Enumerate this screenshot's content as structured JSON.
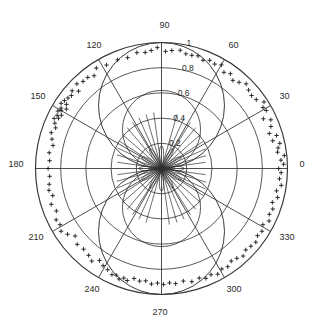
{
  "figure": {
    "title": "",
    "background_color": "#ffffff",
    "line_color": "#3a3a3a",
    "marker_color": "#1a1a1a",
    "curve_color": "#2f2f2f"
  },
  "chart_data": {
    "type": "scatter",
    "projection": "polar",
    "title": "",
    "xlabel": "",
    "ylabel": "",
    "grid": true,
    "legend": false,
    "angle_unit": "degrees",
    "theta_direction": "counterclockwise",
    "theta_zero_location": "E",
    "rlim": [
      0,
      1
    ],
    "angular_ticks": [
      0,
      30,
      60,
      90,
      120,
      150,
      180,
      210,
      240,
      270,
      300,
      330
    ],
    "angular_tick_labels": [
      "0",
      "30",
      "60",
      "90",
      "120",
      "150",
      "180",
      "210",
      "240",
      "270",
      "300",
      "330"
    ],
    "radial_ticks": [
      0.2,
      0.4,
      0.6,
      0.8,
      1.0
    ],
    "radial_tick_labels": [
      "0.2",
      "0.4",
      "0.6",
      "0.8",
      "1"
    ],
    "radial_label_angle": 80,
    "series": [
      {
        "name": "reference-curve",
        "type": "line",
        "description": "vertical lobe pattern |sin(theta)| type response",
        "theta": [
          0,
          5,
          10,
          15,
          20,
          25,
          30,
          35,
          40,
          45,
          50,
          55,
          60,
          65,
          70,
          75,
          80,
          85,
          90,
          95,
          100,
          105,
          110,
          115,
          120,
          125,
          130,
          135,
          140,
          145,
          150,
          155,
          160,
          165,
          170,
          175,
          180,
          185,
          190,
          195,
          200,
          205,
          210,
          215,
          220,
          225,
          230,
          235,
          240,
          245,
          250,
          255,
          260,
          265,
          270,
          275,
          280,
          285,
          290,
          295,
          300,
          305,
          310,
          315,
          320,
          325,
          330,
          335,
          340,
          345,
          350,
          355,
          360
        ],
        "r": [
          0.0,
          0.087,
          0.174,
          0.259,
          0.342,
          0.423,
          0.5,
          0.574,
          0.643,
          0.707,
          0.766,
          0.819,
          0.866,
          0.906,
          0.94,
          0.966,
          0.985,
          0.996,
          1.0,
          0.996,
          0.985,
          0.966,
          0.94,
          0.906,
          0.866,
          0.819,
          0.766,
          0.707,
          0.643,
          0.574,
          0.5,
          0.423,
          0.342,
          0.259,
          0.174,
          0.087,
          0.0,
          0.087,
          0.174,
          0.259,
          0.342,
          0.423,
          0.5,
          0.574,
          0.643,
          0.707,
          0.766,
          0.819,
          0.866,
          0.906,
          0.94,
          0.966,
          0.985,
          0.996,
          1.0,
          0.996,
          0.985,
          0.966,
          0.94,
          0.906,
          0.866,
          0.819,
          0.766,
          0.707,
          0.643,
          0.574,
          0.5,
          0.423,
          0.342,
          0.259,
          0.174,
          0.087,
          0.0
        ]
      },
      {
        "name": "inner-lobe-curve",
        "type": "line",
        "description": "small inner sidelobe rosette near origin",
        "lobe_count": 12,
        "lobe_radius": 0.18
      },
      {
        "name": "radial-fan-lines",
        "type": "line",
        "description": "dense thin spokes radiating from origin to about r=0.45",
        "angles": [
          8,
          16,
          24,
          33,
          41,
          50,
          58,
          66,
          74,
          98,
          106,
          114,
          122,
          130,
          139,
          147,
          155,
          163,
          172,
          188,
          196,
          204,
          213,
          221,
          230,
          238,
          246,
          254,
          278,
          286,
          294,
          302,
          310,
          319,
          327,
          335,
          343,
          352
        ],
        "max_radius": 0.45
      },
      {
        "name": "measurements",
        "type": "scatter",
        "marker": "+",
        "marker_color": "#1a1a1a",
        "points": [
          {
            "theta": 0,
            "r": 0.93
          },
          {
            "theta": 2,
            "r": 0.97
          },
          {
            "theta": 4,
            "r": 0.95
          },
          {
            "theta": 6,
            "r": 0.98
          },
          {
            "theta": 8,
            "r": 0.93
          },
          {
            "theta": 10,
            "r": 0.94
          },
          {
            "theta": 12,
            "r": 0.96
          },
          {
            "theta": 14,
            "r": 0.91
          },
          {
            "theta": 16,
            "r": 0.95
          },
          {
            "theta": 18,
            "r": 0.9
          },
          {
            "theta": 21,
            "r": 0.93
          },
          {
            "theta": 24,
            "r": 0.95
          },
          {
            "theta": 26,
            "r": 0.9
          },
          {
            "theta": 29,
            "r": 0.95
          },
          {
            "theta": 31,
            "r": 0.94
          },
          {
            "theta": 33,
            "r": 0.97
          },
          {
            "theta": 36,
            "r": 0.93
          },
          {
            "theta": 39,
            "r": 0.92
          },
          {
            "theta": 42,
            "r": 0.93
          },
          {
            "theta": 45,
            "r": 0.95
          },
          {
            "theta": 48,
            "r": 0.92
          },
          {
            "theta": 51,
            "r": 0.9
          },
          {
            "theta": 54,
            "r": 0.93
          },
          {
            "theta": 57,
            "r": 0.91
          },
          {
            "theta": 60,
            "r": 0.95
          },
          {
            "theta": 63,
            "r": 0.93
          },
          {
            "theta": 66,
            "r": 0.94
          },
          {
            "theta": 69,
            "r": 0.92
          },
          {
            "theta": 72,
            "r": 0.94
          },
          {
            "theta": 75,
            "r": 0.93
          },
          {
            "theta": 78,
            "r": 0.93
          },
          {
            "theta": 81,
            "r": 0.95
          },
          {
            "theta": 85,
            "r": 0.94
          },
          {
            "theta": 88,
            "r": 0.93
          },
          {
            "theta": 92,
            "r": 0.96
          },
          {
            "theta": 95,
            "r": 0.94
          },
          {
            "theta": 98,
            "r": 0.93
          },
          {
            "theta": 102,
            "r": 0.94
          },
          {
            "theta": 107,
            "r": 0.92
          },
          {
            "theta": 112,
            "r": 0.93
          },
          {
            "theta": 118,
            "r": 0.93
          },
          {
            "theta": 123,
            "r": 0.95
          },
          {
            "theta": 126,
            "r": 0.91
          },
          {
            "theta": 129,
            "r": 0.93
          },
          {
            "theta": 132,
            "r": 0.93
          },
          {
            "theta": 135,
            "r": 0.95
          },
          {
            "theta": 137,
            "r": 0.9
          },
          {
            "theta": 139,
            "r": 0.94
          },
          {
            "theta": 141,
            "r": 0.92
          },
          {
            "theta": 143,
            "r": 0.93
          },
          {
            "theta": 145,
            "r": 0.94
          },
          {
            "theta": 146,
            "r": 0.91
          },
          {
            "theta": 147,
            "r": 0.95
          },
          {
            "theta": 148,
            "r": 0.89
          },
          {
            "theta": 149,
            "r": 0.93
          },
          {
            "theta": 150,
            "r": 0.92
          },
          {
            "theta": 151,
            "r": 0.94
          },
          {
            "theta": 152,
            "r": 0.9
          },
          {
            "theta": 153,
            "r": 0.93
          },
          {
            "theta": 154,
            "r": 0.91
          },
          {
            "theta": 155,
            "r": 0.94
          },
          {
            "theta": 157,
            "r": 0.92
          },
          {
            "theta": 159,
            "r": 0.9
          },
          {
            "theta": 162,
            "r": 0.92
          },
          {
            "theta": 165,
            "r": 0.9
          },
          {
            "theta": 168,
            "r": 0.88
          },
          {
            "theta": 172,
            "r": 0.9
          },
          {
            "theta": 176,
            "r": 0.89
          },
          {
            "theta": 180,
            "r": 0.9
          },
          {
            "theta": 184,
            "r": 0.89
          },
          {
            "theta": 188,
            "r": 0.9
          },
          {
            "theta": 191,
            "r": 0.91
          },
          {
            "theta": 194,
            "r": 0.89
          },
          {
            "theta": 198,
            "r": 0.92
          },
          {
            "theta": 202,
            "r": 0.9
          },
          {
            "theta": 206,
            "r": 0.93
          },
          {
            "theta": 209,
            "r": 0.92
          },
          {
            "theta": 212,
            "r": 0.94
          },
          {
            "theta": 215,
            "r": 0.91
          },
          {
            "theta": 218,
            "r": 0.87
          },
          {
            "theta": 222,
            "r": 0.9
          },
          {
            "theta": 226,
            "r": 0.89
          },
          {
            "theta": 230,
            "r": 0.9
          },
          {
            "theta": 233,
            "r": 0.92
          },
          {
            "theta": 236,
            "r": 0.88
          },
          {
            "theta": 239,
            "r": 0.9
          },
          {
            "theta": 242,
            "r": 0.91
          },
          {
            "theta": 245,
            "r": 0.93
          },
          {
            "theta": 247,
            "r": 0.92
          },
          {
            "theta": 249,
            "r": 0.94
          },
          {
            "theta": 251,
            "r": 0.92
          },
          {
            "theta": 253,
            "r": 0.93
          },
          {
            "theta": 256,
            "r": 0.9
          },
          {
            "theta": 259,
            "r": 0.91
          },
          {
            "theta": 262,
            "r": 0.9
          },
          {
            "theta": 265,
            "r": 0.92
          },
          {
            "theta": 268,
            "r": 0.91
          },
          {
            "theta": 271,
            "r": 0.92
          },
          {
            "theta": 274,
            "r": 0.91
          },
          {
            "theta": 277,
            "r": 0.92
          },
          {
            "theta": 281,
            "r": 0.91
          },
          {
            "theta": 285,
            "r": 0.93
          },
          {
            "theta": 289,
            "r": 0.92
          },
          {
            "theta": 292,
            "r": 0.94
          },
          {
            "theta": 295,
            "r": 0.93
          },
          {
            "theta": 298,
            "r": 0.95
          },
          {
            "theta": 301,
            "r": 0.93
          },
          {
            "theta": 304,
            "r": 0.94
          },
          {
            "theta": 307,
            "r": 0.92
          },
          {
            "theta": 310,
            "r": 0.93
          },
          {
            "theta": 313,
            "r": 0.95
          },
          {
            "theta": 316,
            "r": 0.93
          },
          {
            "theta": 319,
            "r": 0.94
          },
          {
            "theta": 322,
            "r": 0.95
          },
          {
            "theta": 325,
            "r": 0.93
          },
          {
            "theta": 328,
            "r": 0.94
          },
          {
            "theta": 331,
            "r": 0.92
          },
          {
            "theta": 334,
            "r": 0.95
          },
          {
            "theta": 337,
            "r": 0.93
          },
          {
            "theta": 340,
            "r": 0.94
          },
          {
            "theta": 343,
            "r": 0.92
          },
          {
            "theta": 346,
            "r": 0.95
          },
          {
            "theta": 349,
            "r": 0.93
          },
          {
            "theta": 352,
            "r": 0.96
          },
          {
            "theta": 355,
            "r": 0.94
          },
          {
            "theta": 358,
            "r": 0.95
          }
        ]
      }
    ]
  }
}
